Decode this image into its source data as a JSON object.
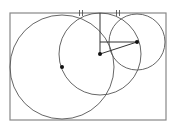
{
  "diagram": {
    "type": "geometry-construction",
    "colors": {
      "stroke": "#555555",
      "rect": "#888888",
      "point": "#111111",
      "background": "#ffffff"
    },
    "rectangle": {
      "x": 10,
      "y": 13,
      "width": 156,
      "height": 107
    },
    "circles": [
      {
        "name": "large-circle",
        "cx": 62,
        "cy": 67,
        "r": 52
      },
      {
        "name": "medium-circle",
        "cx": 100,
        "cy": 54,
        "r": 41
      },
      {
        "name": "small-circle",
        "cx": 137,
        "cy": 42,
        "r": 28
      }
    ],
    "points": [
      {
        "name": "large-center",
        "x": 62,
        "y": 67
      },
      {
        "name": "medium-center",
        "x": 100,
        "y": 54
      },
      {
        "name": "small-center",
        "x": 137,
        "y": 42
      }
    ],
    "segments": [
      {
        "name": "vertical-segment",
        "x1": 100,
        "y1": 13,
        "x2": 100,
        "y2": 54
      },
      {
        "name": "horizontal-segment",
        "x1": 100,
        "y1": 42,
        "x2": 137,
        "y2": 42
      },
      {
        "name": "center-connector",
        "x1": 100,
        "y1": 54,
        "x2": 137,
        "y2": 42
      }
    ],
    "tick_marks": [
      {
        "name": "equal-tick-left",
        "x": 81,
        "y": 13,
        "label": "||"
      },
      {
        "name": "equal-tick-right",
        "x": 118,
        "y": 13,
        "label": "||"
      }
    ]
  }
}
